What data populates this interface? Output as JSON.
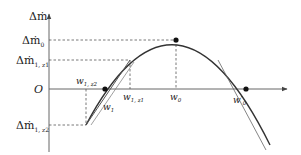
{
  "diagram": {
    "y_axis_label": "Δṁ",
    "origin_label": "O",
    "y_ticks": [
      {
        "main": "Δṁ",
        "sub": "0",
        "y": 40
      },
      {
        "main": "Δṁ",
        "sub": "1, z1",
        "y": 60
      },
      {
        "main": "Δṁ",
        "sub": "1, z2",
        "y": 125
      }
    ],
    "x_labels": [
      {
        "main": "w",
        "sub": "1, z2",
        "x": 86,
        "position": "above"
      },
      {
        "main": "w",
        "sub": "1",
        "x": 105,
        "position": "below"
      },
      {
        "main": "w",
        "sub": "1, z1",
        "x": 130,
        "position": "below"
      },
      {
        "main": "w",
        "sub": "0",
        "x": 176,
        "position": "below"
      },
      {
        "main": "w′",
        "sub": "0",
        "x": 246,
        "position": "below"
      }
    ],
    "points": [
      {
        "name": "peak",
        "x": 176,
        "y": 40
      },
      {
        "name": "w1-crossing",
        "x": 105,
        "y": 89
      },
      {
        "name": "w0prime-crossing",
        "x": 246,
        "y": 89
      }
    ],
    "colors": {
      "curve": "#333333",
      "axis": "#555555",
      "dashed": "#555555"
    }
  }
}
